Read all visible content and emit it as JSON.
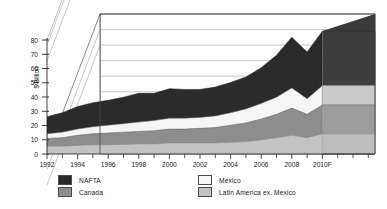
{
  "chart_data": {
    "type": "area",
    "stacked": true,
    "projection": "3d",
    "title": "",
    "subtitle": "",
    "xlabel": "",
    "ylabel": "$ Billion",
    "ylim": [
      0,
      90
    ],
    "ytick_values": [
      0,
      10,
      20,
      30,
      40,
      50,
      60,
      70,
      80
    ],
    "ytick_labels": [
      "0",
      "10",
      "20",
      "30",
      "40",
      "50",
      "60",
      "70",
      "80"
    ],
    "grid": true,
    "legend_position": "bottom",
    "x": [
      1992,
      1993,
      1994,
      1995,
      1996,
      1997,
      1998,
      1999,
      2000,
      2001,
      2002,
      2003,
      2004,
      2005,
      2006,
      2007,
      2008,
      2009,
      2010
    ],
    "xtick_values": [
      1992,
      1994,
      1996,
      1998,
      2000,
      2002,
      2004,
      2006,
      2008,
      2010
    ],
    "xtick_labels": [
      "1992",
      "1994",
      "1996",
      "1998",
      "2000",
      "2002",
      "2004",
      "2006",
      "2008",
      "2010F"
    ],
    "series": [
      {
        "name": "Latin America ex. Mexico",
        "color": "#c3c3c3",
        "stack_order": 1,
        "values": [
          5,
          5,
          5.5,
          6,
          6,
          6.2,
          6.5,
          6.5,
          7,
          7,
          7,
          7,
          7.5,
          8,
          9,
          10.5,
          12,
          10.5,
          13
        ]
      },
      {
        "name": "Canada",
        "color": "#8d8d8d",
        "stack_order": 2,
        "values": [
          5,
          5.5,
          6.5,
          7,
          7.5,
          7.8,
          8,
          8.5,
          9,
          9,
          9.5,
          10,
          11,
          12,
          13.5,
          15,
          17.5,
          15,
          18.5
        ]
      },
      {
        "name": "Mexico",
        "color": "#f2f2f2",
        "stack_order": 3,
        "values": [
          3,
          3.5,
          4,
          4.5,
          5,
          5.5,
          6,
          6.5,
          7,
          7,
          7,
          7.5,
          8,
          9,
          10,
          11,
          13,
          10,
          12.5
        ]
      },
      {
        "name": "NAFTA",
        "color": "#2b2b2b",
        "stack_order": 4,
        "values": [
          11,
          12.5,
          14.5,
          15.5,
          16,
          17,
          18.5,
          17.5,
          19,
          18.5,
          18,
          18.5,
          19.5,
          20.5,
          23,
          27,
          32.5,
          30,
          35
        ]
      }
    ]
  },
  "axes": {
    "y_title": "$ Billion",
    "y_ticks": [
      "80",
      "70",
      "60",
      "50",
      "40",
      "30",
      "20",
      "10",
      "0"
    ],
    "x_ticks": [
      "1992",
      "1994",
      "1996",
      "1998",
      "2000",
      "2002",
      "2004",
      "2006",
      "2008",
      "2010F"
    ]
  },
  "legend": {
    "entries": [
      {
        "label": "NAFTA",
        "color": "#2b2b2b"
      },
      {
        "label": "Canada",
        "color": "#8d8d8d"
      },
      {
        "label": "Mexico",
        "color": "#f7f7f7"
      },
      {
        "label": "Latin America ex. Mexico",
        "color": "#c3c3c3"
      }
    ]
  }
}
